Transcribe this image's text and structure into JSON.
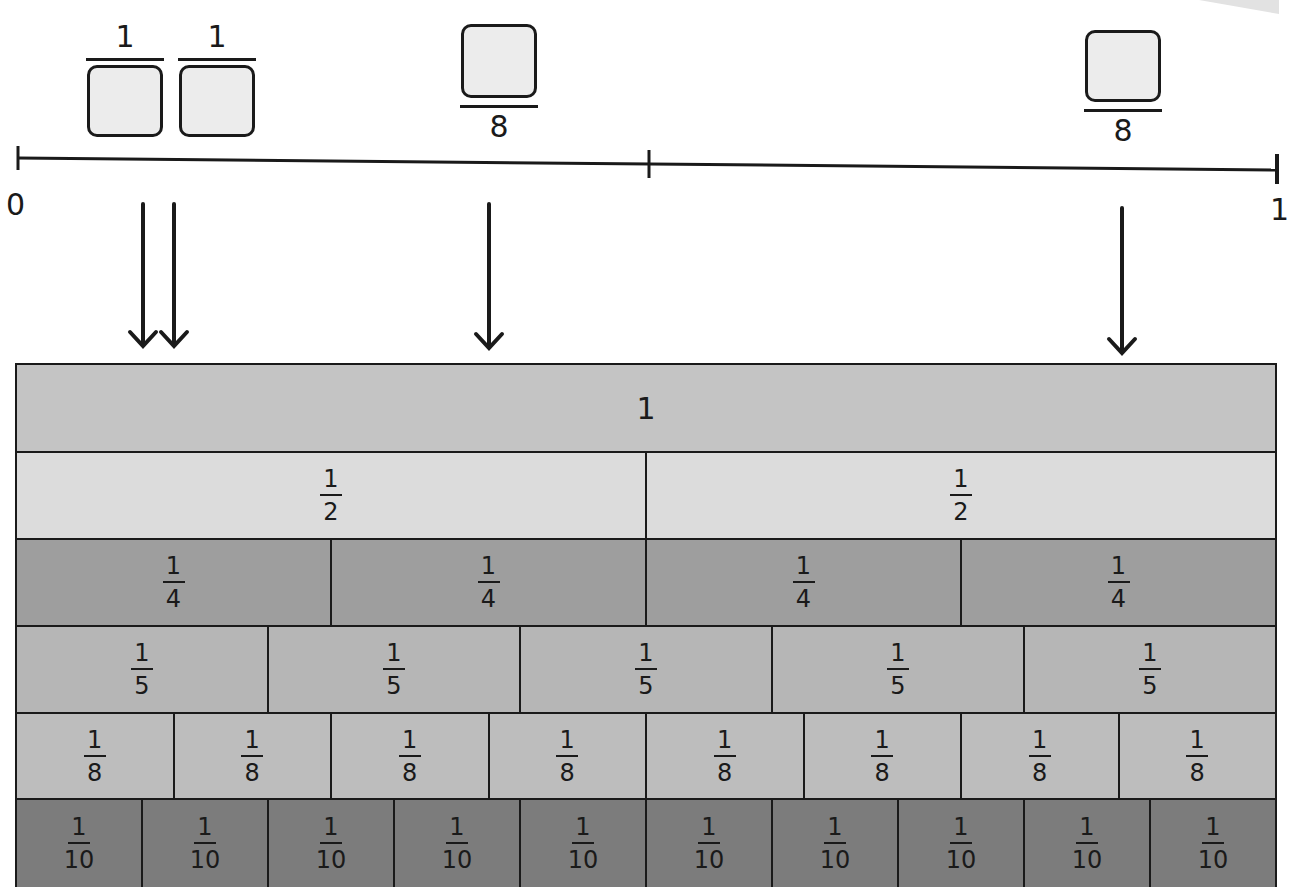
{
  "number_line": {
    "start_label": "0",
    "end_label": "1",
    "midpoint_tick": true
  },
  "unknown_fractions": [
    {
      "id": "a",
      "numerator": "1",
      "denominator": "",
      "missing": "denominator"
    },
    {
      "id": "b",
      "numerator": "1",
      "denominator": "",
      "missing": "denominator"
    },
    {
      "id": "c",
      "numerator": "",
      "denominator": "8",
      "missing": "numerator"
    },
    {
      "id": "d",
      "numerator": "",
      "denominator": "8",
      "missing": "numerator"
    }
  ],
  "fraction_wall": {
    "rows": [
      {
        "name": "whole",
        "count": 1,
        "label": "1",
        "color": "#c4c4c4"
      },
      {
        "name": "halves",
        "count": 2,
        "numerator": "1",
        "denominator": "2",
        "color": "#dcdcdc"
      },
      {
        "name": "quarters",
        "count": 4,
        "numerator": "1",
        "denominator": "4",
        "color": "#9e9e9e"
      },
      {
        "name": "fifths",
        "count": 5,
        "numerator": "1",
        "denominator": "5",
        "color": "#b6b6b6"
      },
      {
        "name": "eighths",
        "count": 8,
        "numerator": "1",
        "denominator": "8",
        "color": "#bdbdbd"
      },
      {
        "name": "tenths",
        "count": 10,
        "numerator": "1",
        "denominator": "10",
        "color": "#7c7c7c"
      }
    ]
  },
  "colors": {
    "ink": "#1a1a1a",
    "answer_box_fill": "#ececec",
    "background": "#ffffff"
  }
}
